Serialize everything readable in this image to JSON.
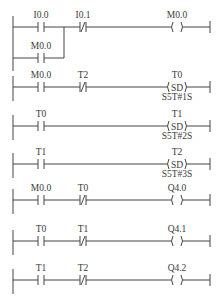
{
  "diagram": {
    "type": "ladder-logic",
    "rungs": [
      {
        "contacts": [
          {
            "addr": "I0.0",
            "type": "NO"
          },
          {
            "addr": "I0.1",
            "type": "NC"
          }
        ],
        "branch": {
          "addr": "M0.0",
          "type": "NO"
        },
        "coil": {
          "addr": "M0.0",
          "type": "coil"
        }
      },
      {
        "contacts": [
          {
            "addr": "M0.0",
            "type": "NO"
          },
          {
            "addr": "T2",
            "type": "NC"
          }
        ],
        "coil": {
          "addr": "T0",
          "type": "SD",
          "preset": "S5T#1S"
        }
      },
      {
        "contacts": [
          {
            "addr": "T0",
            "type": "NO"
          }
        ],
        "coil": {
          "addr": "T1",
          "type": "SD",
          "preset": "S5T#2S"
        }
      },
      {
        "contacts": [
          {
            "addr": "T1",
            "type": "NO"
          }
        ],
        "coil": {
          "addr": "T2",
          "type": "SD",
          "preset": "S5T#3S"
        }
      },
      {
        "contacts": [
          {
            "addr": "M0.0",
            "type": "NO"
          },
          {
            "addr": "T0",
            "type": "NC"
          }
        ],
        "coil": {
          "addr": "Q4.0",
          "type": "coil"
        }
      },
      {
        "contacts": [
          {
            "addr": "T0",
            "type": "NO"
          },
          {
            "addr": "T1",
            "type": "NC"
          }
        ],
        "coil": {
          "addr": "Q4.1",
          "type": "coil"
        }
      },
      {
        "contacts": [
          {
            "addr": "T1",
            "type": "NO"
          },
          {
            "addr": "T2",
            "type": "NC"
          }
        ],
        "coil": {
          "addr": "Q4.2",
          "type": "coil"
        }
      }
    ],
    "sd_label": "(SD)"
  }
}
